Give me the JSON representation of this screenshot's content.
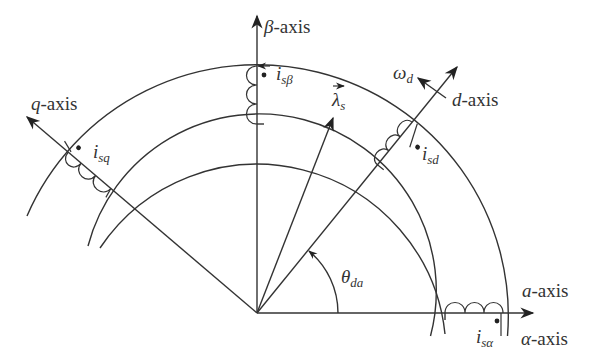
{
  "diagram": {
    "type": "vector-reference-frame",
    "origin": [
      257,
      313
    ],
    "colors": {
      "stroke": "#333333",
      "background": "#ffffff"
    },
    "arcs": [
      {
        "name": "stator-outer",
        "radius": 251
      },
      {
        "name": "airgap-outer",
        "radius": 189
      },
      {
        "name": "rotor-outer",
        "radius": 174
      }
    ],
    "axes": {
      "beta": {
        "label_sym": "β",
        "label_text": "-axis"
      },
      "q": {
        "label_sym": "q",
        "label_text": "-axis"
      },
      "d": {
        "label_sym": "d",
        "label_text": "-axis"
      },
      "a": {
        "label_sym": "a",
        "label_text": "-axis"
      },
      "alpha": {
        "label_sym": "α",
        "label_text": "-axis"
      }
    },
    "vectors": {
      "lambda_s": {
        "sym": "λ",
        "sub": "s"
      },
      "omega_d": {
        "sym": "ω",
        "sub": "d"
      }
    },
    "angle": {
      "sym": "θ",
      "sub": "da"
    },
    "currents": {
      "i_sbeta": {
        "sym": "i",
        "sub": "sβ"
      },
      "i_sq": {
        "sym": "i",
        "sub": "sq"
      },
      "i_sd": {
        "sym": "i",
        "sub": "sd"
      },
      "i_salpha": {
        "sym": "i",
        "sub": "sα"
      }
    }
  }
}
